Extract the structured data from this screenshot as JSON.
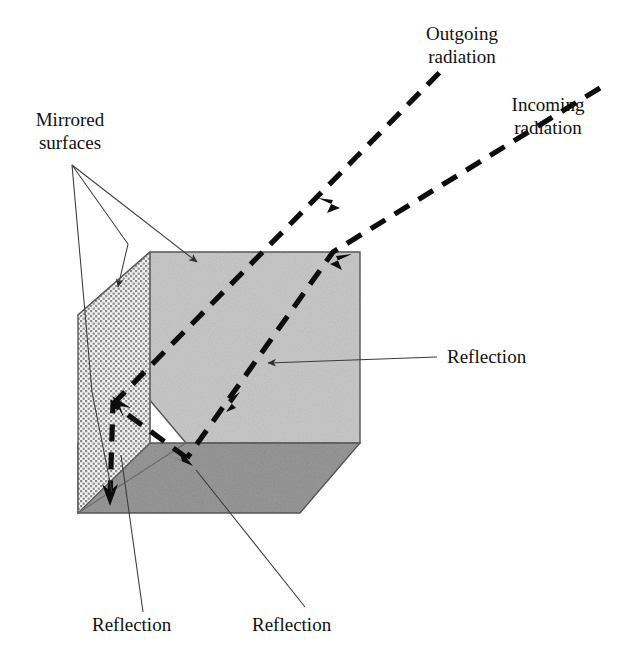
{
  "figure": {
    "kind": "optics-diagram"
  },
  "labels": {
    "outgoing": "Outgoing\nradiation",
    "incoming": "Incoming\nradiation",
    "mirrored": "Mirrored\nsurfaces",
    "reflection_right": "Reflection",
    "reflection_bottom_left": "Reflection",
    "reflection_bottom_mid": "Reflection"
  },
  "colors": {
    "face_light": "#c9c9c9",
    "face_dark": "#9a9a9a",
    "face_dotted_base": "#f2f2f2",
    "dot": "#7d7d7d",
    "outline": "#4a4a4a",
    "ray": "#0d0d0d",
    "leader": "#3a3a3a",
    "text": "#111111"
  },
  "geometry": {
    "cube": {
      "light_face": [
        [
          150,
          252
        ],
        [
          360,
          252
        ],
        [
          360,
          443
        ],
        [
          186,
          443
        ],
        [
          78,
          315
        ]
      ],
      "dark_face": [
        [
          78,
          443
        ],
        [
          186,
          443
        ],
        [
          360,
          443
        ],
        [
          300,
          513
        ],
        [
          78,
          513
        ]
      ],
      "left_face": [
        [
          78,
          315
        ],
        [
          150,
          252
        ],
        [
          150,
          443
        ],
        [
          78,
          513
        ]
      ]
    },
    "rays": {
      "incoming_polyline": [
        [
          600,
          90
        ],
        [
          333,
          252
        ],
        [
          187,
          458
        ]
      ],
      "outgoing_polyline": [
        [
          113,
          404
        ],
        [
          440,
          72
        ]
      ],
      "internal_polyline": [
        [
          187,
          458
        ],
        [
          113,
          404
        ],
        [
          110,
          497
        ]
      ]
    },
    "arrow_points": [
      {
        "name": "incoming-arrow-upper",
        "x": 345,
        "y": 262
      },
      {
        "name": "outgoing-arrow-upper",
        "x": 325,
        "y": 205
      },
      {
        "name": "incoming-arrow-lower",
        "x": 233,
        "y": 400
      },
      {
        "name": "reflection-arrow-bottom",
        "x": 186,
        "y": 458
      },
      {
        "name": "reflection-arrow-left",
        "x": 119,
        "y": 415
      },
      {
        "name": "reflection-arrow-leftdown",
        "x": 110,
        "y": 497
      }
    ]
  }
}
